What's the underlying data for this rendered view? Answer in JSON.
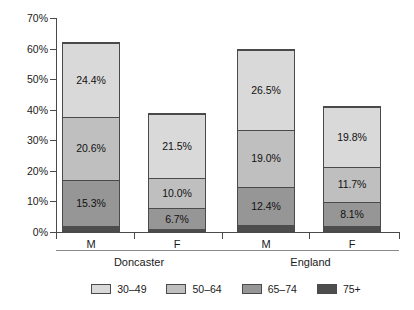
{
  "chart_data": {
    "type": "bar",
    "subtype": "stacked-bar",
    "title": "",
    "xlabel": "",
    "ylabel": "",
    "ylim": [
      0,
      70
    ],
    "ytick_labels": [
      "0%",
      "10%",
      "20%",
      "30%",
      "40%",
      "50%",
      "60%",
      "70%"
    ],
    "ytick_values": [
      0,
      10,
      20,
      30,
      40,
      50,
      60,
      70
    ],
    "grid": false,
    "legend_position": "bottom",
    "value_suffix": "%",
    "categories": [
      "M",
      "F",
      "M",
      "F"
    ],
    "groups": [
      {
        "label": "Doncaster",
        "categories": [
          "M",
          "F"
        ]
      },
      {
        "label": "England",
        "categories": [
          "M",
          "F"
        ]
      }
    ],
    "series": [
      {
        "name": "30–49",
        "color": "#d9d9d9",
        "values": [
          24.4,
          21.5,
          26.5,
          19.8
        ]
      },
      {
        "name": "50–64",
        "color": "#bfbfbf",
        "values": [
          20.6,
          10.0,
          19.0,
          11.7
        ]
      },
      {
        "name": "65–74",
        "color": "#969696",
        "values": [
          15.3,
          6.7,
          12.4,
          8.1
        ]
      },
      {
        "name": "75+",
        "color": "#4d4d4d",
        "values": [
          1.7,
          0.8,
          2.1,
          1.6
        ]
      }
    ],
    "bar_totals": [
      62.0,
      39.0,
      60.0,
      41.2
    ],
    "labelled_segments": [
      {
        "bar": 0,
        "series": "30–49",
        "label": "24.4%"
      },
      {
        "bar": 0,
        "series": "50–64",
        "label": "20.6%"
      },
      {
        "bar": 0,
        "series": "65–74",
        "label": "15.3%"
      },
      {
        "bar": 1,
        "series": "30–49",
        "label": "21.5%"
      },
      {
        "bar": 1,
        "series": "50–64",
        "label": "10.0%"
      },
      {
        "bar": 1,
        "series": "65–74",
        "label": "6.7%"
      },
      {
        "bar": 2,
        "series": "30–49",
        "label": "26.5%"
      },
      {
        "bar": 2,
        "series": "50–64",
        "label": "19.0%"
      },
      {
        "bar": 2,
        "series": "65–74",
        "label": "12.4%"
      },
      {
        "bar": 3,
        "series": "30–49",
        "label": "19.8%"
      },
      {
        "bar": 3,
        "series": "50–64",
        "label": "11.7%"
      },
      {
        "bar": 3,
        "series": "65–74",
        "label": "8.1%"
      }
    ]
  },
  "axis": {
    "ticks": [
      {
        "label": "70%",
        "value": 70
      },
      {
        "label": "60%",
        "value": 60
      },
      {
        "label": "50%",
        "value": 50
      },
      {
        "label": "40%",
        "value": 40
      },
      {
        "label": "30%",
        "value": 30
      },
      {
        "label": "20%",
        "value": 20
      },
      {
        "label": "10%",
        "value": 10
      },
      {
        "label": "0%",
        "value": 0
      }
    ]
  },
  "bars": [
    {
      "category": "M",
      "group": "Doncaster",
      "total": 62.0,
      "segments": [
        {
          "series": "75+",
          "value": 1.7,
          "label": "",
          "color": "#4d4d4d"
        },
        {
          "series": "65–74",
          "value": 15.3,
          "label": "15.3%",
          "color": "#969696"
        },
        {
          "series": "50–64",
          "value": 20.6,
          "label": "20.6%",
          "color": "#bfbfbf"
        },
        {
          "series": "30–49",
          "value": 24.4,
          "label": "24.4%",
          "color": "#d9d9d9"
        }
      ]
    },
    {
      "category": "F",
      "group": "Doncaster",
      "total": 39.0,
      "segments": [
        {
          "series": "75+",
          "value": 0.8,
          "label": "",
          "color": "#4d4d4d"
        },
        {
          "series": "65–74",
          "value": 6.7,
          "label": "6.7%",
          "color": "#969696"
        },
        {
          "series": "50–64",
          "value": 10.0,
          "label": "10.0%",
          "color": "#bfbfbf"
        },
        {
          "series": "30–49",
          "value": 21.5,
          "label": "21.5%",
          "color": "#d9d9d9"
        }
      ]
    },
    {
      "category": "M",
      "group": "England",
      "total": 60.0,
      "segments": [
        {
          "series": "75+",
          "value": 2.1,
          "label": "",
          "color": "#4d4d4d"
        },
        {
          "series": "65–74",
          "value": 12.4,
          "label": "12.4%",
          "color": "#969696"
        },
        {
          "series": "50–64",
          "value": 19.0,
          "label": "19.0%",
          "color": "#bfbfbf"
        },
        {
          "series": "30–49",
          "value": 26.5,
          "label": "26.5%",
          "color": "#d9d9d9"
        }
      ]
    },
    {
      "category": "F",
      "group": "England",
      "total": 41.2,
      "segments": [
        {
          "series": "75+",
          "value": 1.6,
          "label": "",
          "color": "#4d4d4d"
        },
        {
          "series": "65–74",
          "value": 8.1,
          "label": "8.1%",
          "color": "#969696"
        },
        {
          "series": "50–64",
          "value": 11.7,
          "label": "11.7%",
          "color": "#bfbfbf"
        },
        {
          "series": "30–49",
          "value": 19.8,
          "label": "19.8%",
          "color": "#d9d9d9"
        }
      ]
    }
  ],
  "legend": {
    "items": [
      {
        "label": "30–49",
        "color": "#d9d9d9"
      },
      {
        "label": "50–64",
        "color": "#bfbfbf"
      },
      {
        "label": "65–74",
        "color": "#969696"
      },
      {
        "label": "75+",
        "color": "#4d4d4d"
      }
    ]
  }
}
